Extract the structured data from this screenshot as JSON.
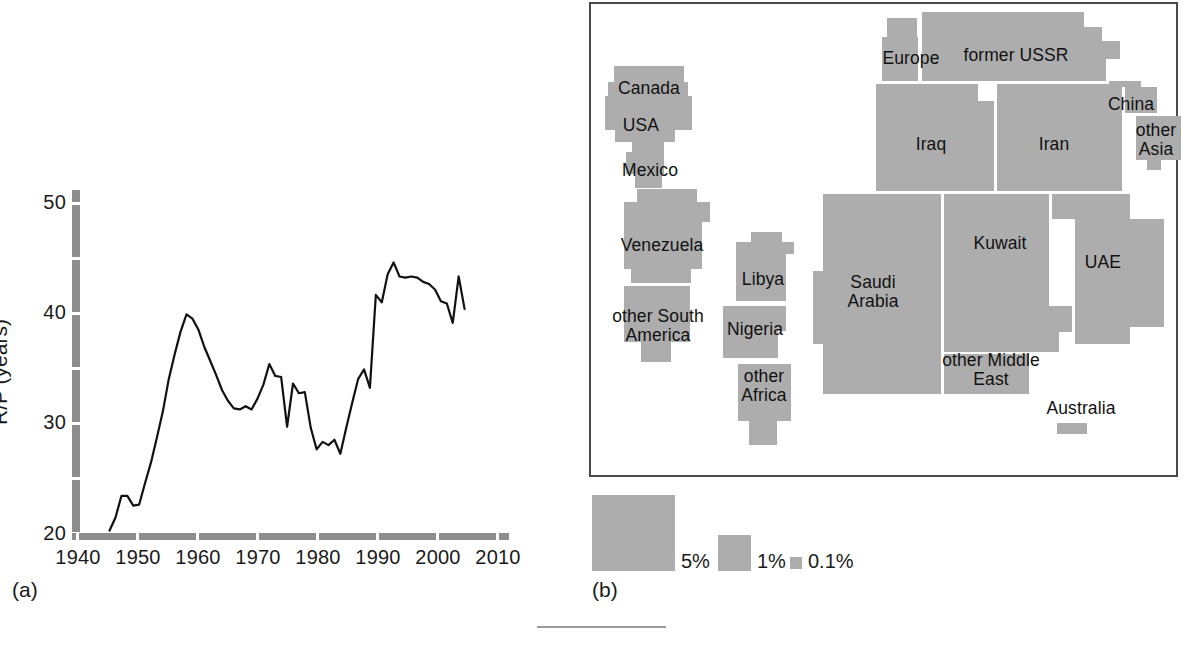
{
  "figure": {
    "panel_a_caption": "(a)",
    "panel_b_caption": "(b)"
  },
  "chart_data": {
    "type": "line",
    "title": "",
    "xlabel": "",
    "ylabel": "R/P (years)",
    "xlim": [
      1940,
      2012
    ],
    "ylim": [
      19.4,
      51.5
    ],
    "xticks": [
      1940,
      1950,
      1960,
      1970,
      1980,
      1990,
      2000,
      2010
    ],
    "yticks": [
      20,
      30,
      40,
      50
    ],
    "yminorticks": [
      25,
      35,
      45
    ],
    "grid": false,
    "legend": null,
    "series": [
      {
        "name": "R/P ratio",
        "x": [
          1945,
          1946,
          1947,
          1948,
          1949,
          1950,
          1951,
          1952,
          1953,
          1954,
          1955,
          1956,
          1957,
          1958,
          1959,
          1960,
          1961,
          1962,
          1963,
          1964,
          1965,
          1966,
          1967,
          1968,
          1969,
          1970,
          1971,
          1972,
          1973,
          1974,
          1975,
          1976,
          1977,
          1978,
          1979,
          1980,
          1981,
          1982,
          1983,
          1984,
          1985,
          1986,
          1987,
          1988,
          1989,
          1990,
          1991,
          1992,
          1993,
          1994,
          1995,
          1996,
          1997,
          1998,
          1999,
          2000,
          2001,
          2002,
          2003,
          2004,
          2005
        ],
        "values": [
          20.0,
          21.2,
          23.2,
          23.2,
          22.3,
          22.4,
          24.4,
          26.3,
          28.6,
          31.0,
          34.0,
          36.3,
          38.4,
          40.0,
          39.6,
          38.6,
          37.0,
          35.7,
          34.4,
          33.0,
          32.0,
          31.3,
          31.2,
          31.5,
          31.2,
          32.2,
          33.5,
          35.4,
          34.3,
          34.2,
          29.6,
          33.6,
          32.7,
          32.8,
          29.5,
          27.5,
          28.2,
          27.9,
          28.4,
          27.1,
          29.5,
          31.8,
          34.0,
          34.9,
          33.2,
          41.8,
          41.1,
          43.7,
          44.8,
          43.5,
          43.4,
          43.5,
          43.4,
          43.0,
          42.8,
          42.3,
          41.2,
          41.0,
          39.2,
          43.5,
          40.5
        ]
      }
    ],
    "axis_color": "#8d8d8d",
    "line_color": "#111111"
  },
  "cartogram": {
    "fill_color": "#adadad",
    "border_color": "#4a4a4a",
    "regions": [
      {
        "id": "canada",
        "label": "Canada"
      },
      {
        "id": "usa",
        "label": "USA"
      },
      {
        "id": "mexico",
        "label": "Mexico"
      },
      {
        "id": "venezuela",
        "label": "Venezuela"
      },
      {
        "id": "other-south-america",
        "label": "other South\nAmerica"
      },
      {
        "id": "libya",
        "label": "Libya"
      },
      {
        "id": "nigeria",
        "label": "Nigeria"
      },
      {
        "id": "other-africa",
        "label": "other\nAfrica"
      },
      {
        "id": "europe",
        "label": "Europe"
      },
      {
        "id": "former-ussr",
        "label": "former USSR"
      },
      {
        "id": "iraq",
        "label": "Iraq"
      },
      {
        "id": "iran",
        "label": "Iran"
      },
      {
        "id": "china",
        "label": "China"
      },
      {
        "id": "other-asia",
        "label": "other\nAsia"
      },
      {
        "id": "saudi-arabia",
        "label": "Saudi\nArabia"
      },
      {
        "id": "kuwait",
        "label": "Kuwait"
      },
      {
        "id": "uae",
        "label": "UAE"
      },
      {
        "id": "other-middle-east",
        "label": "other Middle\nEast"
      },
      {
        "id": "australia",
        "label": "Australia"
      }
    ],
    "legend": [
      {
        "id": "legend-5",
        "label": "5%"
      },
      {
        "id": "legend-1",
        "label": "1%"
      },
      {
        "id": "legend-01",
        "label": "0.1%"
      }
    ]
  }
}
